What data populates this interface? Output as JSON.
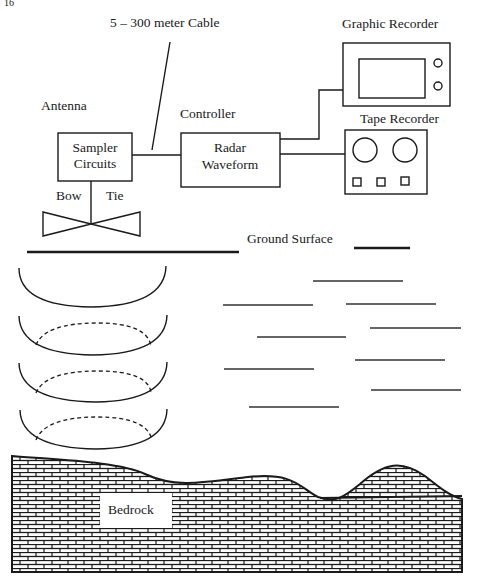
{
  "figure": {
    "corner_mark": "16",
    "labels": {
      "cable": "5 – 300 meter Cable",
      "graphic_recorder": "Graphic Recorder",
      "antenna": "Antenna",
      "controller": "Controller",
      "tape_recorder": "Tape Recorder",
      "sampler_line1": "Sampler",
      "sampler_line2": "Circuits",
      "radar_line1": "Radar",
      "radar_line2": "Waveform",
      "bow": "Bow",
      "tie": "Tie",
      "ground_surface": "Ground Surface",
      "bedrock": "Bedrock"
    },
    "components": [
      {
        "name": "Sampler Circuits",
        "group": "Antenna"
      },
      {
        "name": "Radar Waveform",
        "group": "Controller"
      },
      {
        "name": "Graphic Recorder"
      },
      {
        "name": "Tape Recorder"
      },
      {
        "name": "Bow Tie antenna"
      }
    ],
    "connections": [
      {
        "from": "Sampler Circuits",
        "to": "Radar Waveform",
        "label": "5 – 300 meter Cable"
      },
      {
        "from": "Radar Waveform",
        "to": "Graphic Recorder"
      },
      {
        "from": "Radar Waveform",
        "to": "Tape Recorder"
      },
      {
        "from": "Sampler Circuits",
        "to": "Bow Tie antenna"
      }
    ],
    "wavefronts": {
      "count": 4,
      "dashed_inner": 3
    },
    "reflector_count": 10,
    "colors": {
      "ink": "#1a1a1a",
      "paper": "#ffffff"
    }
  }
}
